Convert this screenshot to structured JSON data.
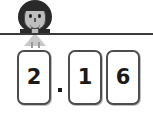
{
  "scene": {
    "type": "place-value-decimal-card-activity",
    "background_color": "#ffffff",
    "rule_color": "#3a3a3a"
  },
  "character": {
    "name": "girl-figure",
    "hair_color": "#2a2a2a",
    "skin_color": "#bdbdbd",
    "dress_color": "#c9c9c9"
  },
  "number_display": {
    "value": "2.16",
    "separator": ".",
    "cards": [
      {
        "digit": "2"
      },
      {
        "digit": "1"
      },
      {
        "digit": "6"
      }
    ],
    "card_border_color": "#4d4d4d",
    "card_fill_color": "#ffffff",
    "digit_color": "#1a1a1a"
  }
}
